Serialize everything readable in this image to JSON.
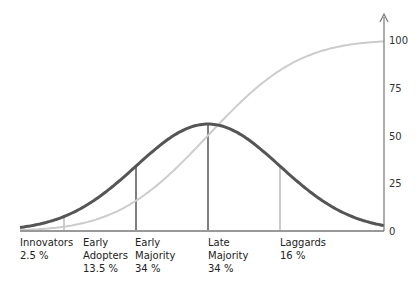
{
  "chart_data": {
    "type": "line",
    "title": "",
    "xlabel": "",
    "ylabel": "",
    "ylim": [
      0,
      100
    ],
    "y_ticks": [
      "0",
      "25",
      "50",
      "75",
      "100"
    ],
    "y_tick_values": [
      0,
      25,
      50,
      75,
      100
    ],
    "grid": false,
    "series": [
      {
        "name": "Adoption (bell curve)",
        "color": "#555555",
        "description": "normal distribution of adopters, peak ~56 at mean"
      },
      {
        "name": "Cumulative adoption (S-curve)",
        "color": "#cccccc",
        "description": "cumulative share reaching 100"
      }
    ],
    "segments": [
      {
        "name": "Innovators",
        "share": "2.5 %"
      },
      {
        "name": "Early Adopters",
        "share": "13.5 %"
      },
      {
        "name": "Early Majority",
        "share": "34 %"
      },
      {
        "name": "Late Majority",
        "share": "34 %"
      },
      {
        "name": "Laggards",
        "share": "16 %"
      }
    ],
    "segment_boundaries_sd": [
      -2,
      -1,
      0,
      1
    ],
    "bell_peak_value": 56
  }
}
